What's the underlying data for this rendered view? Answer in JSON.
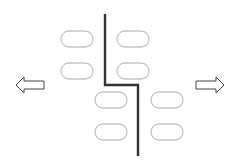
{
  "diagram": {
    "colors": {
      "oval_stroke": "#c4c4c4",
      "line": "#333333",
      "arrow_stroke": "#444444",
      "background": "#ffffff"
    },
    "ovals": [
      {
        "cx": 77,
        "cy": 39,
        "group": "left-top"
      },
      {
        "cx": 133,
        "cy": 39,
        "group": "right-top"
      },
      {
        "cx": 77,
        "cy": 71,
        "group": "left-top"
      },
      {
        "cx": 133,
        "cy": 71,
        "group": "right-top"
      },
      {
        "cx": 111,
        "cy": 100,
        "group": "left-bottom"
      },
      {
        "cx": 166,
        "cy": 100,
        "group": "right-bottom"
      },
      {
        "cx": 111,
        "cy": 132,
        "group": "left-bottom"
      },
      {
        "cx": 166,
        "cy": 132,
        "group": "right-bottom"
      }
    ],
    "arrows": [
      {
        "direction": "left"
      },
      {
        "direction": "right"
      }
    ]
  }
}
